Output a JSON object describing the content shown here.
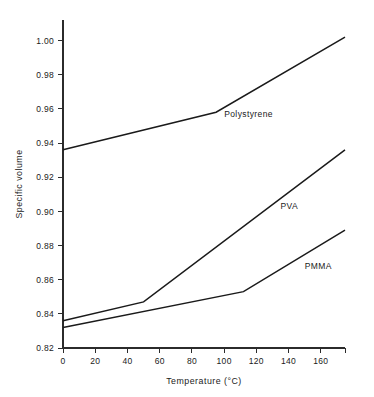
{
  "chart_data": {
    "type": "line",
    "title": "",
    "xlabel": "Temperature  (°C)",
    "ylabel": "Specific volume",
    "xlim": [
      0,
      175
    ],
    "ylim": [
      0.82,
      1.012
    ],
    "grid": false,
    "legend_position": "inline-labels",
    "xticks": [
      0,
      20,
      40,
      60,
      80,
      100,
      120,
      140,
      160
    ],
    "xtick_labels": [
      "0",
      "20",
      "40",
      "60",
      "80",
      "100",
      "120",
      "140",
      "160"
    ],
    "yticks": [
      0.82,
      0.84,
      0.86,
      0.88,
      0.9,
      0.92,
      0.94,
      0.96,
      0.98,
      1.0
    ],
    "ytick_labels": [
      "0.82",
      "0.84",
      "0.86",
      "0.88",
      "0.90",
      "0.92",
      "0.94",
      "0.96",
      "0.98",
      "1.00"
    ],
    "series": [
      {
        "name": "Polystyrene",
        "label": "Polystyrene",
        "label_x": 100,
        "label_y": 0.9555,
        "x": [
          0,
          95,
          175
        ],
        "y": [
          0.936,
          0.958,
          1.002
        ]
      },
      {
        "name": "PVA",
        "label": "PVA",
        "label_x": 135,
        "label_y": 0.9015,
        "x": [
          0,
          50,
          175
        ],
        "y": [
          0.836,
          0.847,
          0.936
        ]
      },
      {
        "name": "PMMA",
        "label": "PMMA",
        "label_x": 150,
        "label_y": 0.8665,
        "x": [
          0,
          112,
          175
        ],
        "y": [
          0.832,
          0.853,
          0.889
        ]
      }
    ],
    "colors": {
      "line": "#1a1a1a",
      "axis": "#2b2b2b",
      "background": "#ffffff"
    }
  }
}
